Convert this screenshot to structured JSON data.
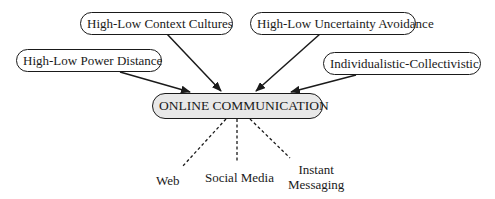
{
  "diagram": {
    "center": {
      "label": "ONLINE COMMUNICATION",
      "fill": "#e8e8e8"
    },
    "influences": [
      {
        "id": "power-distance",
        "label": "High-Low Power Distance"
      },
      {
        "id": "context-cultures",
        "label": "High-Low Context Cultures"
      },
      {
        "id": "uncertainty-avoidance",
        "label": "High-Low Uncertainty Avoidance"
      },
      {
        "id": "individualistic-collectivistic",
        "label": "Individualistic-Collectivistic"
      }
    ],
    "channels": [
      {
        "id": "web",
        "label": "Web"
      },
      {
        "id": "social-media",
        "label": "Social Media"
      },
      {
        "id": "instant-messaging",
        "label_line1": "Instant",
        "label_line2": "Messaging"
      }
    ],
    "edge_styles": {
      "influence": "solid-arrow",
      "channel": "dashed"
    }
  }
}
